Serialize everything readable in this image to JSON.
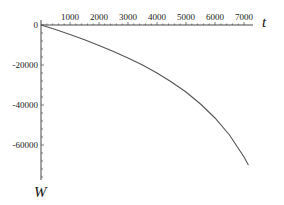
{
  "chart_data": {
    "type": "line",
    "title": "",
    "xlabel": "t",
    "ylabel": "W",
    "xlim": [
      0,
      7150
    ],
    "ylim": [
      -76000,
      1500
    ],
    "grid": false,
    "legend": null,
    "x_ticks": [
      1000,
      2000,
      3000,
      4000,
      5000,
      6000,
      7000
    ],
    "x_tick_labels": [
      "1000",
      "2000",
      "3000",
      "4000",
      "5000",
      "6000",
      "7000"
    ],
    "y_ticks": [
      0,
      -20000,
      -40000,
      -60000
    ],
    "y_tick_labels": [
      "0",
      "-20000",
      "-40000",
      "-60000"
    ],
    "series": [
      {
        "name": "W(t)",
        "color": "#555555",
        "x": [
          0,
          500,
          1000,
          1500,
          2000,
          2500,
          3000,
          3500,
          4000,
          4500,
          5000,
          5500,
          6000,
          6500,
          7000,
          7150
        ],
        "y": [
          0,
          -2300,
          -4800,
          -7400,
          -10200,
          -13200,
          -16500,
          -20000,
          -24000,
          -28500,
          -33500,
          -39500,
          -46500,
          -55000,
          -66000,
          -70000
        ]
      }
    ]
  },
  "labels": {
    "x_axis": "t",
    "y_axis": "W"
  }
}
